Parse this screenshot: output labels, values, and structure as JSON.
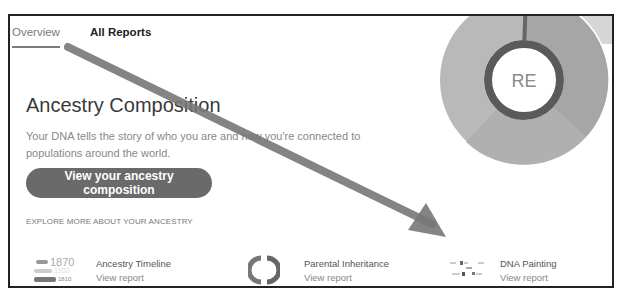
{
  "tabs": [
    {
      "label": "Overview",
      "active": true
    },
    {
      "label": "All Reports",
      "active": false
    }
  ],
  "hero": {
    "title": "Ancestry Composition",
    "description": "Your DNA tells the story of who you are and how you're connected to populations around the world.",
    "cta_label": "View your ancestry composition"
  },
  "explore_label": "EXPLORE MORE ABOUT YOUR ANCESTRY",
  "cards": [
    {
      "name": "Ancestry Timeline",
      "link": "View report",
      "icon": "timeline-icon"
    },
    {
      "name": "Parental Inheritance",
      "link": "View report",
      "icon": "ring-split-icon"
    },
    {
      "name": "DNA Painting",
      "link": "View report",
      "icon": "chromosome-dots-icon"
    }
  ],
  "timeline_icon": {
    "years": [
      "1870",
      "1930",
      "1810"
    ]
  },
  "donut": {
    "center_label": "RE",
    "colors": {
      "outer_main": "#a8a8a8",
      "outer_alt": "#bdbdbd",
      "inner_ring": "#5a5a5a",
      "sliver": "#666666"
    }
  },
  "annotation": {
    "type": "arrow",
    "color": "#777777"
  }
}
